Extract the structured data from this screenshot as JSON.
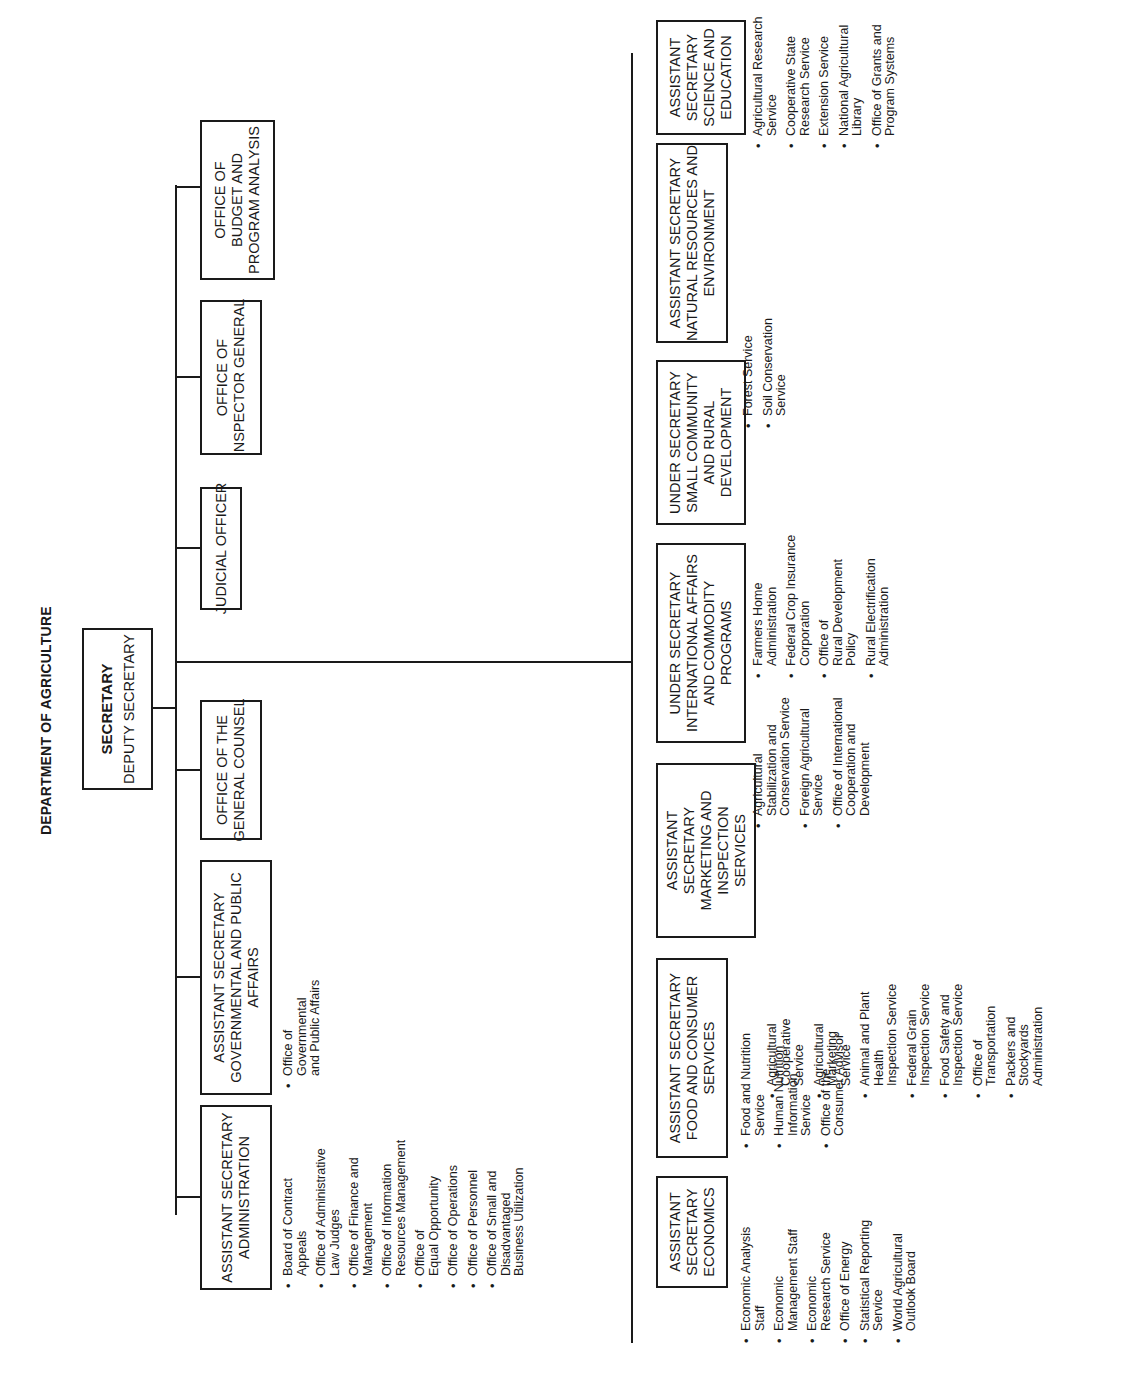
{
  "title": "DEPARTMENT OF AGRICULTURE",
  "secretary": {
    "title": "SECRETARY",
    "deputy": "DEPUTY SECRETARY"
  },
  "staff_offices": [
    {
      "lines": [
        "ASSISTANT SECRETARY",
        "ADMINISTRATION"
      ],
      "subunits": [
        "Board of Contract\nAppeals",
        "Office of Administrative\nLaw Judges",
        "Office of Finance and\nManagement",
        "Office of Information\nResources Management",
        "Office of\nEqual Opportunity",
        "Office of Operations",
        "Office of Personnel",
        "Office of Small and\nDisadvantaged\nBusiness Utilization"
      ]
    },
    {
      "lines": [
        "ASSISTANT SECRETARY",
        "GOVERNMENTAL AND PUBLIC",
        "AFFAIRS"
      ],
      "subunits": [
        "Office of\nGovernmental\nand Public Affairs"
      ]
    },
    {
      "lines": [
        "OFFICE OF THE",
        "GENERAL COUNSEL"
      ],
      "subunits": []
    },
    {
      "lines": [
        "JUDICIAL OFFICER"
      ],
      "subunits": []
    },
    {
      "lines": [
        "OFFICE OF",
        "INSPECTOR GENERAL"
      ],
      "subunits": []
    },
    {
      "lines": [
        "OFFICE OF",
        "BUDGET AND",
        "PROGRAM ANALYSIS"
      ],
      "subunits": []
    }
  ],
  "program_offices": [
    {
      "lines": [
        "ASSISTANT",
        "SECRETARY",
        "ECONOMICS"
      ],
      "subunits": [
        "Economic Analysis\nStaff",
        "Economic\nManagement Staff",
        "Economic\nResearch Service",
        "Office of Energy",
        "Statistical Reporting\nService",
        "World Agricultural\nOutlook Board"
      ]
    },
    {
      "lines": [
        "ASSISTANT SECRETARY",
        "FOOD AND CONSUMER",
        "SERVICES"
      ],
      "subunits": [
        "Food and Nutrition\nService",
        "Human Nutrition\nInformation\nService",
        "Office of the\nConsumer Advisor"
      ]
    },
    {
      "lines": [
        "ASSISTANT",
        "SECRETARY",
        "MARKETING AND",
        "INSPECTION",
        "SERVICES"
      ],
      "subunits": [
        "Agricultural\nCooperative\nService",
        "Agricultural\nMarketing\nService",
        "Animal and Plant\nHealth\nInspection Service",
        "Federal Grain\nInspection Service",
        "Food Safety and\nInspection Service",
        "Office of\nTransportation",
        "Packers and\nStockyards\nAdministration"
      ]
    },
    {
      "lines": [
        "UNDER SECRETARY",
        "INTERNATIONAL AFFAIRS",
        "AND COMMODITY",
        "PROGRAMS"
      ],
      "subunits": [
        "Agricultural\nStabilization and\nConservation Service",
        "Foreign Agricultural\nService",
        "Office of International\nCooperation and\nDevelopment"
      ]
    },
    {
      "lines": [
        "UNDER SECRETARY",
        "SMALL COMMUNITY",
        "AND RURAL",
        "DEVELOPMENT"
      ],
      "subunits": [
        "Farmers Home\nAdministration",
        "Federal Crop Insurance\nCorporation",
        "Office of\nRural Development\nPolicy",
        "Rural Electrification\nAdministration"
      ]
    },
    {
      "lines": [
        "ASSISTANT SECRETARY",
        "NATURAL RESOURCES AND",
        "ENVIRONMENT"
      ],
      "subunits": [
        "Forest Service",
        "Soil Conservation\nService"
      ]
    },
    {
      "lines": [
        "ASSISTANT",
        "SECRETARY",
        "SCIENCE AND",
        "EDUCATION"
      ],
      "subunits": [
        "Agricultural Research\nService",
        "Cooperative State\nResearch Service",
        "Extension Service",
        "National Agricultural\nLibrary",
        "Office of Grants and\nProgram Systems"
      ]
    }
  ]
}
